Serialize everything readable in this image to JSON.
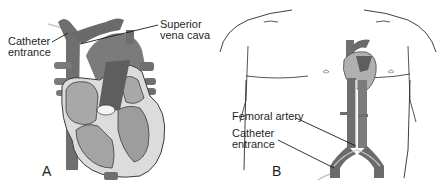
{
  "figure": {
    "panel_a": {
      "letter": "A",
      "subject": "Heart cross-section",
      "labels": {
        "catheter_entrance_line1": "Catheter",
        "catheter_entrance_line2": "entrance",
        "superior_vena_cava_line1": "Superior",
        "superior_vena_cava_line2": "vena cava"
      }
    },
    "panel_b": {
      "letter": "B",
      "subject": "Torso outline with heart and aorta",
      "labels": {
        "femoral_artery": "Femoral artery",
        "catheter_entrance_line1": "Catheter",
        "catheter_entrance_line2": "entrance"
      }
    },
    "colors": {
      "vessel_dark": "#6b6b6b",
      "vessel_mid": "#8a8a8a",
      "chamber_fill": "#a9a9a9",
      "wall_light": "#d9d9d9",
      "outline": "#2a2a2a",
      "background": "#ffffff"
    }
  }
}
